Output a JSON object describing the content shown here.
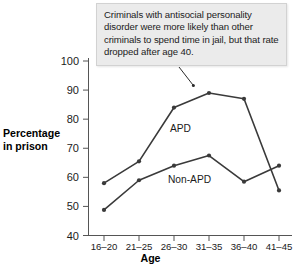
{
  "callout": {
    "text": "Criminals with antisocial personality disorder were more likely than other criminals to spend time in jail, but that rate dropped after age 40."
  },
  "axes": {
    "y_title_line1": "Percentage",
    "y_title_line2": "in prison",
    "x_title": "Age"
  },
  "chart_data": {
    "type": "line",
    "title": "",
    "subtitle": "",
    "xlabel": "Age",
    "ylabel": "Percentage in prison",
    "categories": [
      "16–20",
      "21–25",
      "26–30",
      "31–35",
      "36–40",
      "41–45"
    ],
    "ylim": [
      40,
      100
    ],
    "yticks": [
      40,
      50,
      60,
      70,
      80,
      90,
      100
    ],
    "ytick_labels": [
      "40",
      "50",
      "60",
      "70",
      "80",
      "90",
      "100"
    ],
    "grid": false,
    "legend": "inline-labels",
    "series": [
      {
        "name": "APD",
        "values": [
          58,
          65.5,
          84,
          89,
          87,
          55.5
        ],
        "color": "#3a3a3a",
        "label_position": "above-line"
      },
      {
        "name": "Non-APD",
        "values": [
          48.8,
          59,
          64,
          67.5,
          58.5,
          64
        ],
        "color": "#3a3a3a",
        "label_position": "below-line"
      }
    ],
    "annotations": [
      {
        "text": "Criminals with antisocial personality disorder were more likely than other criminals to spend time in jail, but that rate dropped after age 40.",
        "points_to_series": "APD",
        "points_to_category": "31–35"
      }
    ]
  }
}
